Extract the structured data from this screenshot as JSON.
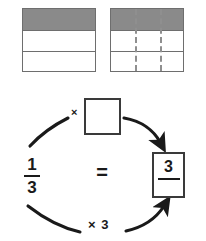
{
  "diagram": {
    "models": [
      {
        "name": "bar-model-thirds",
        "rows": 3,
        "shaded_rows": 1,
        "columns": 1,
        "dashed_dividers": 0,
        "fraction": "1/3"
      },
      {
        "name": "bar-model-ninths",
        "rows": 3,
        "shaded_rows": 1,
        "columns": 3,
        "dashed_dividers": 2,
        "fraction": "3/9"
      }
    ],
    "equation": {
      "left_fraction": {
        "numerator": "1",
        "denominator": "3"
      },
      "equals": "=",
      "right_fraction": {
        "numerator": "3",
        "denominator": ""
      },
      "multiplier_box": {
        "value": "",
        "placeholder": ""
      },
      "top_operator": "×",
      "bottom_operator": "× 3"
    },
    "colors": {
      "shade": "#8a8a8a",
      "outline": "#6e6e6e",
      "box_outline": "#3a3a3a",
      "dash": "#8f8f8f",
      "ink": "#1a1a1a",
      "background": "#ffffff"
    }
  }
}
